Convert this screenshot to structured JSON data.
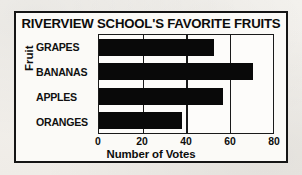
{
  "chart_data": {
    "type": "bar",
    "orientation": "horizontal",
    "title": "RIVERVIEW SCHOOL'S FAVORITE FRUITS",
    "xlabel": "Number of Votes",
    "ylabel": "Fruit",
    "categories": [
      "GRAPES",
      "BANANAS",
      "APPLES",
      "ORANGES"
    ],
    "values": [
      53,
      71,
      57,
      38
    ],
    "xlim": [
      0,
      80
    ],
    "xticks": [
      0,
      20,
      40,
      60,
      80
    ],
    "xtick_labels": [
      "0",
      "20",
      "40",
      "60",
      "80"
    ],
    "gridlines": [
      20,
      40,
      60
    ],
    "grid": true,
    "legend": false,
    "bar_color": "#090909",
    "frame_color": "#151515",
    "background_color": "#fbfaf7"
  }
}
